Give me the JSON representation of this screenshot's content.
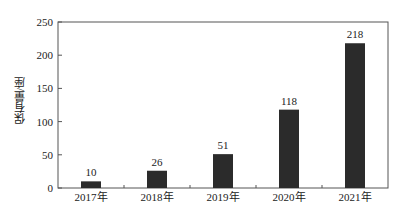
{
  "chart_data": {
    "type": "bar",
    "title": "",
    "xlabel": "",
    "ylabel": "保有量/座",
    "categories": [
      "2017年",
      "2018年",
      "2019年",
      "2020年",
      "2021年"
    ],
    "values": [
      10,
      26,
      51,
      118,
      218
    ],
    "data_labels": [
      "10",
      "26",
      "51",
      "118",
      "218"
    ],
    "ylim": [
      0,
      250
    ],
    "yticks": [
      "0",
      "50",
      "100",
      "150",
      "200",
      "250"
    ],
    "grid": false,
    "legend": null,
    "bar_color": "#2b2b2b"
  }
}
